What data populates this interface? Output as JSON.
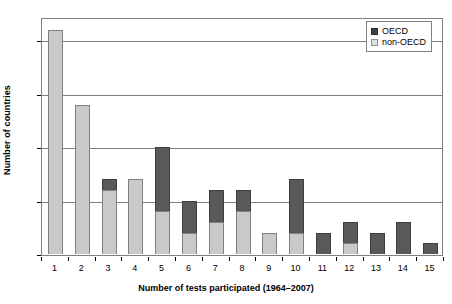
{
  "chart_data": {
    "type": "bar",
    "subtype": "stacked-bar",
    "title": "",
    "xlabel": "Number of tests participated (1964–2007)",
    "ylabel": "Number of countries",
    "categories": [
      "1",
      "2",
      "3",
      "4",
      "5",
      "6",
      "7",
      "8",
      "9",
      "10",
      "11",
      "12",
      "13",
      "14",
      "15"
    ],
    "series": [
      {
        "name": "non-OECD",
        "color": "#c9c9c9",
        "values": [
          21,
          14,
          6,
          7,
          4,
          2,
          3,
          4,
          2,
          2,
          0,
          1,
          0,
          0,
          0
        ]
      },
      {
        "name": "OECD",
        "color": "#595959",
        "values": [
          0,
          0,
          1,
          0,
          6,
          3,
          3,
          2,
          0,
          5,
          2,
          2,
          2,
          3,
          1
        ]
      }
    ],
    "totals": [
      21,
      14,
      7,
      7,
      10,
      5,
      6,
      6,
      2,
      7,
      2,
      3,
      2,
      3,
      1
    ],
    "ylim": [
      0,
      22.1
    ],
    "yticks": [
      "0",
      "5",
      "10",
      "15",
      "20"
    ],
    "ytick_values": [
      0,
      5,
      10,
      15,
      20
    ],
    "grid": "horizontal",
    "legend_position": "top-right",
    "stack_order": [
      "non-OECD",
      "OECD"
    ]
  },
  "legend": {
    "entries": [
      {
        "label": "OECD",
        "swatch": "dark-square-swatch"
      },
      {
        "label": "non-OECD",
        "swatch": "light-square-swatch"
      }
    ]
  }
}
